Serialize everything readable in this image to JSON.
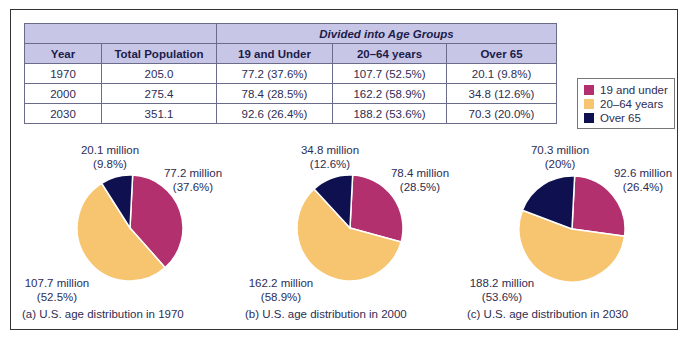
{
  "table": {
    "group_header": "Divided into Age Groups",
    "headers": [
      "Year",
      "Total Population",
      "19 and Under",
      "20–64 years",
      "Over 65"
    ],
    "rows": [
      [
        "1970",
        "205.0",
        "77.2 (37.6%)",
        "107.7 (52.5%)",
        "20.1 (9.8%)"
      ],
      [
        "2000",
        "275.4",
        "78.4 (28.5%)",
        "162.2 (58.9%)",
        "34.8 (12.6%)"
      ],
      [
        "2030",
        "351.1",
        "92.6 (26.4%)",
        "188.2 (53.6%)",
        "70.3 (20.0%)"
      ]
    ]
  },
  "legend": {
    "items": [
      {
        "label": "19 and under",
        "color": "#b3306e"
      },
      {
        "label": "20–64 years",
        "color": "#f7c46f"
      },
      {
        "label": "Over 65",
        "color": "#0f1050"
      }
    ]
  },
  "pies": [
    {
      "caption": "(a) U.S. age distribution in 1970",
      "labels": {
        "over65": [
          "20.1 million",
          "(9.8%)"
        ],
        "under19": [
          "77.2 million",
          "(37.6%)"
        ],
        "mid": [
          "107.7 million",
          "(52.5%)"
        ]
      }
    },
    {
      "caption": "(b) U.S. age distribution in 2000",
      "labels": {
        "over65": [
          "34.8 million",
          "(12.6%)"
        ],
        "under19": [
          "78.4 million",
          "(28.5%)"
        ],
        "mid": [
          "162.2 million",
          "(58.9%)"
        ]
      }
    },
    {
      "caption": "(c) U.S. age distribution in 2030",
      "labels": {
        "over65": [
          "70.3 million",
          "(20%)"
        ],
        "under19": [
          "92.6 million",
          "(26.4%)"
        ],
        "mid": [
          "188.2 million",
          "(53.6%)"
        ]
      }
    }
  ],
  "chart_data": [
    {
      "type": "table",
      "title": "Divided into Age Groups",
      "columns": [
        "Year",
        "Total Population",
        "19 and Under",
        "20–64 years",
        "Over 65"
      ],
      "rows": [
        [
          1970,
          205.0,
          "77.2 (37.6%)",
          "107.7 (52.5%)",
          "20.1 (9.8%)"
        ],
        [
          2000,
          275.4,
          "78.4 (28.5%)",
          "162.2 (58.9%)",
          "34.8 (12.6%)"
        ],
        [
          2030,
          351.1,
          "92.6 (26.4%)",
          "188.2 (53.6%)",
          "70.3 (20.0%)"
        ]
      ]
    },
    {
      "type": "pie",
      "title": "(a) U.S. age distribution in 1970",
      "categories": [
        "19 and under",
        "20–64 years",
        "Over 65"
      ],
      "values": [
        77.2,
        107.7,
        20.1
      ],
      "percentages": [
        37.6,
        52.5,
        9.8
      ],
      "units": "million",
      "colors": [
        "#b3306e",
        "#f7c46f",
        "#0f1050"
      ],
      "legend_position": "right"
    },
    {
      "type": "pie",
      "title": "(b) U.S. age distribution in 2000",
      "categories": [
        "19 and under",
        "20–64 years",
        "Over 65"
      ],
      "values": [
        78.4,
        162.2,
        34.8
      ],
      "percentages": [
        28.5,
        58.9,
        12.6
      ],
      "units": "million",
      "colors": [
        "#b3306e",
        "#f7c46f",
        "#0f1050"
      ]
    },
    {
      "type": "pie",
      "title": "(c) U.S. age distribution in 2030",
      "categories": [
        "19 and under",
        "20–64 years",
        "Over 65"
      ],
      "values": [
        92.6,
        188.2,
        70.3
      ],
      "percentages": [
        26.4,
        53.6,
        20.0
      ],
      "units": "million",
      "colors": [
        "#b3306e",
        "#f7c46f",
        "#0f1050"
      ]
    }
  ]
}
